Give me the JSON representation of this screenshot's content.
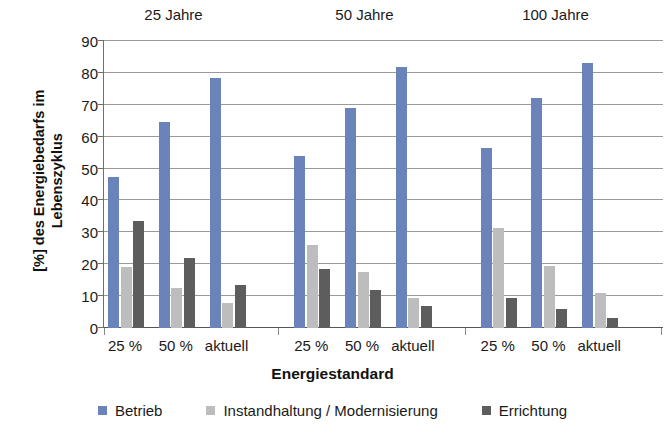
{
  "chart_data": {
    "type": "bar",
    "title": "",
    "xlabel": "Energiestandard",
    "ylabel": "[%] des Energiebedarfs im Lebenszyklus",
    "ylabel_lines": [
      "[%] des Energiebedarfs im",
      "Lebenszyklus"
    ],
    "ylim": [
      0,
      90
    ],
    "yticks": [
      0,
      10,
      20,
      30,
      40,
      50,
      60,
      70,
      80,
      90
    ],
    "grid": true,
    "legend_position": "bottom",
    "group_labels": [
      "25 Jahre",
      "50 Jahre",
      "100 Jahre"
    ],
    "categories": [
      "25 %",
      "50 %",
      "aktuell"
    ],
    "series": [
      {
        "name": "Betrieb",
        "color": "#6a83bb",
        "values_by_group": [
          [
            47.5,
            64.5,
            78.5
          ],
          [
            54.0,
            69.0,
            82.0
          ],
          [
            56.5,
            72.0,
            83.0
          ]
        ]
      },
      {
        "name": "Instandhaltung / Modernisierung",
        "color": "#bdbdbd",
        "values_by_group": [
          [
            19.0,
            12.5,
            8.0
          ],
          [
            26.0,
            17.5,
            9.5
          ],
          [
            31.5,
            19.5,
            11.0
          ]
        ]
      },
      {
        "name": "Errichtung",
        "color": "#5d5d5d",
        "values_by_group": [
          [
            33.5,
            22.0,
            13.5
          ],
          [
            18.5,
            12.0,
            7.0
          ],
          [
            9.5,
            6.0,
            3.0
          ]
        ]
      }
    ]
  },
  "legend": {
    "items": [
      {
        "label": "Betrieb",
        "color": "#6a83bb"
      },
      {
        "label": "Instandhaltung / Modernisierung",
        "color": "#bdbdbd"
      },
      {
        "label": "Errichtung",
        "color": "#5d5d5d"
      }
    ]
  },
  "axis": {
    "x_title": "Energiestandard"
  }
}
